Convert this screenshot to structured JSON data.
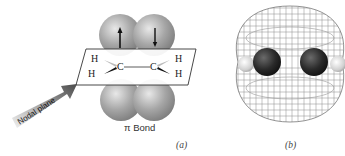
{
  "figure": {
    "panel_a": {
      "label": "(a)",
      "caption": "π Bond",
      "arrow_label": "Nodal plane",
      "atoms": {
        "h_top_left": "H",
        "h_bottom_left": "H",
        "c_left": "C",
        "c_right": "C",
        "h_top_right": "H",
        "h_bottom_right": "H"
      },
      "bond_line": "—",
      "spin_up": "↑",
      "spin_down": "↓"
    },
    "panel_b": {
      "label": "(b)"
    }
  },
  "colors": {
    "lobe_gray": "#9a9a9a",
    "carbon_dark": "#2a2a2a",
    "hydrogen_light": "#d8d8d8",
    "mesh": "#8a8a8a",
    "plane_line": "#333333",
    "arrow_dark": "#555555"
  }
}
